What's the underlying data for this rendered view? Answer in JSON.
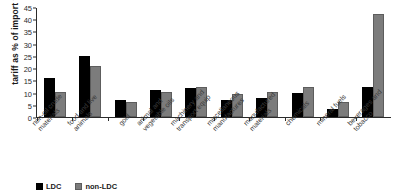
{
  "chart_data": {
    "type": "bar",
    "title": "",
    "xlabel": "",
    "ylabel": "tariff as % of import values",
    "ylim": [
      0,
      45
    ],
    "ytick_step": 5,
    "yticks": [
      0,
      5,
      10,
      15,
      20,
      25,
      30,
      35,
      40,
      45
    ],
    "grid": false,
    "legend_position": "bottom-left",
    "categories": [
      "non-oil crude materials",
      "food and live animals",
      "gold",
      "animal and vegetable oils",
      "machinery and transport equip",
      "miscellaneous manufactures",
      "manufactured materials",
      "chemicals",
      "mineral fuels",
      "beverages and tobacco"
    ],
    "category_lines": [
      [
        "non-oil crude",
        "materials"
      ],
      [
        "food and live",
        "animals"
      ],
      [
        "gold"
      ],
      [
        "animal and",
        "vegetable oils"
      ],
      [
        "machinery and",
        "transport equip"
      ],
      [
        "miscellaneous",
        "manufactures"
      ],
      [
        "manufactured",
        "materials"
      ],
      [
        "chemicals"
      ],
      [
        "mineral fuels"
      ],
      [
        "beverages and",
        "tobacco"
      ]
    ],
    "series": [
      {
        "name": "LDC",
        "color": "#000000",
        "values": [
          16.0,
          25.0,
          7.0,
          11.0,
          11.7,
          7.0,
          7.7,
          10.0,
          3.3,
          12.3
        ]
      },
      {
        "name": "non-LDC",
        "color": "#7c7c7c",
        "values": [
          10.3,
          20.8,
          6.3,
          10.2,
          12.4,
          9.3,
          10.2,
          12.4,
          6.2,
          42.0
        ]
      }
    ]
  },
  "legend": {
    "items": [
      {
        "label": "LDC"
      },
      {
        "label": "non-LDC"
      }
    ]
  }
}
